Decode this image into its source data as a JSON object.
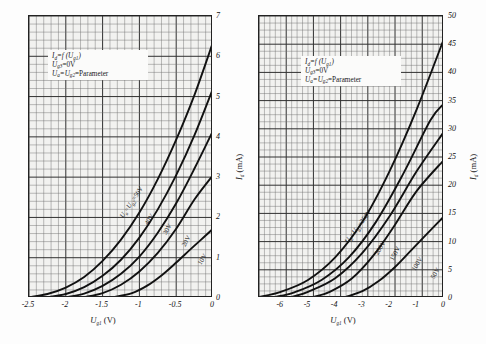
{
  "figure": {
    "title": "",
    "panels": [
      {
        "id": "left-panel",
        "legend": {
          "line1_pre": "I",
          "line1_sub": "d",
          "line1_mid": "=f (U",
          "line1_sub2": "g1",
          "line1_post": ")",
          "line2_pre": "U",
          "line2_sub": "g3",
          "line2_post": "=0V",
          "line3_pre": "U",
          "line3_sub": "a",
          "line3_mid": "=U",
          "line3_sub2": "g2",
          "line3_post": "=Parameter"
        },
        "xlabel_pre": "U",
        "xlabel_sub": "g1",
        "xlabel_post": " (V)",
        "ylabel_pre": "I",
        "ylabel_sub": "d",
        "ylabel_post": " (mA)",
        "xticks": [
          "-2.5",
          "-2",
          "-1.5",
          "-1",
          "-0.5",
          "0"
        ],
        "yticks": [
          "1",
          "2",
          "3",
          "4",
          "5",
          "6",
          "7"
        ],
        "curve_labels": [
          {
            "text_pre": "U",
            "text_sub": "a",
            "text_mid": "=U",
            "text_sub2": "g2",
            "text_post": "=50V"
          },
          {
            "text_pre": "",
            "text_sub": "",
            "text_mid": "",
            "text_sub2": "",
            "text_post": "40V"
          },
          {
            "text_pre": "",
            "text_sub": "",
            "text_mid": "",
            "text_sub2": "",
            "text_post": "30V"
          },
          {
            "text_pre": "",
            "text_sub": "",
            "text_mid": "",
            "text_sub2": "",
            "text_post": "20V"
          },
          {
            "text_pre": "",
            "text_sub": "",
            "text_mid": "",
            "text_sub2": "",
            "text_post": "10V"
          }
        ]
      },
      {
        "id": "right-panel",
        "legend": {
          "line1_pre": "I",
          "line1_sub": "d",
          "line1_mid": "=f (U",
          "line1_sub2": "g1",
          "line1_post": ")",
          "line2_pre": "U",
          "line2_sub": "g3",
          "line2_post": "=0V",
          "line3_pre": "U",
          "line3_sub": "a",
          "line3_mid": "=U",
          "line3_sub2": "g2",
          "line3_post": "=Parameter"
        },
        "xlabel_pre": "U",
        "xlabel_sub": "g1",
        "xlabel_post": " (V)",
        "ylabel_pre": "I",
        "ylabel_sub": "d",
        "ylabel_post": " (mA)",
        "xticks": [
          "-6",
          "-5",
          "-4",
          "-3",
          "-2",
          "-1",
          "0"
        ],
        "yticks": [
          "5",
          "10",
          "15",
          "20",
          "25",
          "30",
          "35",
          "40",
          "45",
          "50"
        ],
        "curve_labels": [
          {
            "text_pre": "U",
            "text_sub": "a",
            "text_mid": "=U",
            "text_sub2": "g2",
            "text_post": "=250V"
          },
          {
            "text_pre": "",
            "text_sub": "",
            "text_mid": "",
            "text_sub2": "",
            "text_post": "200V"
          },
          {
            "text_pre": "",
            "text_sub": "",
            "text_mid": "",
            "text_sub2": "",
            "text_post": "150V"
          },
          {
            "text_pre": "",
            "text_sub": "",
            "text_mid": "",
            "text_sub2": "",
            "text_post": "100V"
          },
          {
            "text_pre": "",
            "text_sub": "",
            "text_mid": "",
            "text_sub2": "",
            "text_post": "50V"
          }
        ]
      }
    ]
  },
  "chart_data": [
    {
      "type": "line",
      "panel": "left",
      "title": "",
      "xlabel": "U_g1 (V)",
      "ylabel": "I_d (mA)",
      "xlim": [
        -2.5,
        0
      ],
      "ylim": [
        0,
        7
      ],
      "xticks": [
        -2.5,
        -2,
        -1.5,
        -1,
        -0.5,
        0
      ],
      "yticks": [
        0,
        1,
        2,
        3,
        4,
        5,
        6,
        7
      ],
      "grid": true,
      "legend_position": "upper-left",
      "annotations": [
        "I_d=f(U_g1)",
        "U_g3=0V",
        "U_a=U_g2=Parameter"
      ],
      "series": [
        {
          "name": "U_a=U_g2=50V",
          "x": [
            -2.5,
            -2.25,
            -2.0,
            -1.75,
            -1.5,
            -1.25,
            -1.0,
            -0.75,
            -0.5,
            -0.25,
            0
          ],
          "y": [
            0.02,
            0.1,
            0.26,
            0.52,
            0.92,
            1.45,
            2.12,
            2.95,
            3.93,
            5.05,
            6.35
          ]
        },
        {
          "name": "40V",
          "x": [
            -2.25,
            -2.0,
            -1.75,
            -1.5,
            -1.25,
            -1.0,
            -0.75,
            -0.5,
            -0.25,
            0
          ],
          "y": [
            0.02,
            0.1,
            0.27,
            0.55,
            0.95,
            1.5,
            2.2,
            3.05,
            4.05,
            5.2
          ]
        },
        {
          "name": "30V",
          "x": [
            -2.0,
            -1.75,
            -1.5,
            -1.25,
            -1.0,
            -0.75,
            -0.5,
            -0.25,
            0
          ],
          "y": [
            0.02,
            0.11,
            0.3,
            0.6,
            1.03,
            1.62,
            2.35,
            3.22,
            4.15
          ]
        },
        {
          "name": "20V",
          "x": [
            -1.75,
            -1.5,
            -1.25,
            -1.0,
            -0.75,
            -0.5,
            -0.25,
            0
          ],
          "y": [
            0.02,
            0.12,
            0.33,
            0.66,
            1.12,
            1.72,
            2.45,
            3.05
          ]
        },
        {
          "name": "10V",
          "x": [
            -1.35,
            -1.1,
            -0.9,
            -0.7,
            -0.5,
            -0.3,
            -0.1,
            0
          ],
          "y": [
            0.02,
            0.12,
            0.3,
            0.56,
            0.88,
            1.22,
            1.55,
            1.72
          ]
        }
      ]
    },
    {
      "type": "line",
      "panel": "right",
      "title": "",
      "xlabel": "U_g1 (V)",
      "ylabel": "I_d (mA)",
      "xlim": [
        -6.8,
        0
      ],
      "ylim": [
        0,
        50
      ],
      "xticks": [
        -6,
        -5,
        -4,
        -3,
        -2,
        -1,
        0
      ],
      "yticks": [
        0,
        5,
        10,
        15,
        20,
        25,
        30,
        35,
        40,
        45,
        50
      ],
      "grid": true,
      "legend_position": "upper-left",
      "annotations": [
        "I_d=f(U_g1)",
        "U_g3=0V",
        "U_a=U_g2=Parameter"
      ],
      "series": [
        {
          "name": "U_a=U_g2=250V",
          "x": [
            -6.8,
            -6.0,
            -5.0,
            -4.0,
            -3.0,
            -2.0,
            -1.0,
            0
          ],
          "y": [
            0.2,
            1.1,
            3.2,
            7.2,
            13.5,
            22.5,
            33.5,
            46.0
          ]
        },
        {
          "name": "200V",
          "x": [
            -6.2,
            -5.5,
            -4.5,
            -3.5,
            -2.5,
            -1.5,
            -0.5,
            0
          ],
          "y": [
            0.2,
            1.0,
            3.2,
            7.2,
            13.5,
            22.0,
            31.5,
            34.5
          ]
        },
        {
          "name": "150V",
          "x": [
            -5.6,
            -5.0,
            -4.0,
            -3.0,
            -2.0,
            -1.0,
            0
          ],
          "y": [
            0.2,
            1.1,
            3.5,
            8.0,
            14.5,
            22.5,
            29.5
          ]
        },
        {
          "name": "100V",
          "x": [
            -4.8,
            -4.2,
            -3.4,
            -2.6,
            -1.8,
            -1.0,
            0
          ],
          "y": [
            0.2,
            1.1,
            3.4,
            7.5,
            13.0,
            19.0,
            24.5
          ]
        },
        {
          "name": "50V",
          "x": [
            -3.6,
            -3.0,
            -2.4,
            -1.8,
            -1.2,
            -0.6,
            0
          ],
          "y": [
            0.2,
            1.2,
            3.0,
            5.5,
            8.5,
            11.5,
            14.5
          ]
        }
      ]
    }
  ]
}
